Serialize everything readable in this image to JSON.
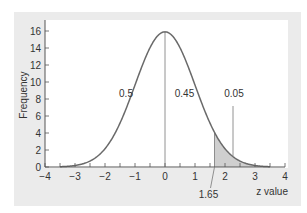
{
  "chart_data": {
    "type": "area",
    "title": "",
    "xlabel": "z value",
    "ylabel": "Frequency",
    "xlim": [
      -4,
      4
    ],
    "ylim": [
      0,
      17
    ],
    "xticks": [
      "-4",
      "-3",
      "-2",
      "-1",
      "0",
      "1",
      "2",
      "3",
      "4"
    ],
    "yticks": [
      "0",
      "2",
      "4",
      "6",
      "8",
      "10",
      "12",
      "14",
      "16"
    ],
    "grid": false,
    "legend": null,
    "series": [
      {
        "name": "normal distribution curve",
        "x": [
          -3.5,
          -3,
          -2.5,
          -2,
          -1.5,
          -1,
          -0.5,
          0,
          0.5,
          1,
          1.5,
          2,
          2.5,
          3,
          3.5
        ],
        "values": [
          0.03,
          0.18,
          0.7,
          2.15,
          5.16,
          9.64,
          14.03,
          15.9,
          14.03,
          9.64,
          5.16,
          2.15,
          0.7,
          0.18,
          0.03
        ]
      }
    ],
    "shaded_region": {
      "from_z": 1.65,
      "to_z": 3.5,
      "color": "#cfcfcf"
    },
    "vertical_lines": [
      {
        "z": 0,
        "label": "mean"
      }
    ],
    "annotations": [
      {
        "text": "0.5",
        "z": -1.3,
        "y": 8.2,
        "meaning": "area left of mean"
      },
      {
        "text": "0.45",
        "z": 0.65,
        "y": 8.2,
        "meaning": "area between 0 and 1.65"
      },
      {
        "text": "0.05",
        "z": 2.3,
        "y": 8.2,
        "meaning": "area right of 1.65"
      },
      {
        "text": "1.65",
        "z": 1.65,
        "meaning": "critical z value"
      }
    ],
    "colors": {
      "curve": "#6a6a6a",
      "shade": "#cfcfcf",
      "panel": "#ebebeb",
      "axis": "#555555"
    }
  }
}
